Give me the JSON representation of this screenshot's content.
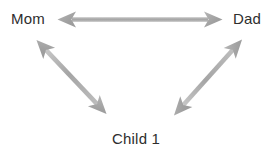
{
  "diagram": {
    "background_color": "#ffffff",
    "arrow_color": "#a8a8a8",
    "arrow_color_light": "#c2c2c2",
    "arrow_color_dark": "#9a9a9a",
    "text_color": "#2e2e2e",
    "nodes": [
      {
        "id": "mom",
        "label": "Mom",
        "position": "top-left"
      },
      {
        "id": "dad",
        "label": "Dad",
        "position": "top-right"
      },
      {
        "id": "child",
        "label": "Child 1",
        "position": "bottom-center"
      }
    ],
    "edges": [
      {
        "id": "mom-dad",
        "from": "Mom",
        "to": "Dad",
        "style": "double-headed-arrow"
      },
      {
        "id": "mom-child",
        "from": "Mom",
        "to": "Child 1",
        "style": "double-headed-arrow"
      },
      {
        "id": "dad-child",
        "from": "Dad",
        "to": "Child 1",
        "style": "double-headed-arrow"
      }
    ]
  }
}
